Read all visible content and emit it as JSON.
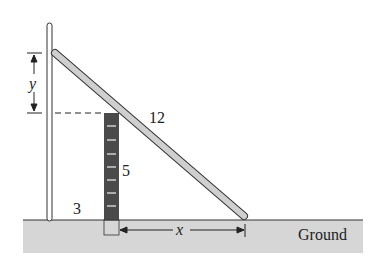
{
  "diagram": {
    "type": "ladder-over-box",
    "labels": {
      "ladder_length": "12",
      "box_height": "5",
      "box_distance": "3",
      "horizontal_unknown": "x",
      "vertical_unknown": "y",
      "ground": "Ground"
    },
    "colors": {
      "ladder_fill": "#cfcfcf",
      "ladder_stroke": "#333333",
      "box_fill": "#4a4a4a",
      "box_stripes": "#cccccc",
      "ground_fill": "#d6d6d6",
      "line": "#222222"
    }
  }
}
